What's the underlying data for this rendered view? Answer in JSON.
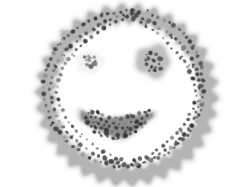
{
  "image": {
    "title": "Smiley face bacterial colony plate",
    "width": 252,
    "height": 187,
    "background_color": "#ffffff",
    "border_color": "#a8a8a8",
    "border_inset_px": 5,
    "medium_color": "#ffffff"
  },
  "palette": {
    "halo": "#d2d2d2",
    "band": "#b4b4b4",
    "band_edge": "#a5a5a5",
    "mouth_fill": "#8f8f8f",
    "mouth_halo": "#c6c6c6",
    "eye_fill": "#c0c0c0",
    "eye_halo": "#d8d8d8",
    "colony_dark": "#3a3a3a",
    "colony_mid": "#5e5e5e",
    "colony_light": "#8a8a8a"
  },
  "features": [
    {
      "name": "face-outline-ring",
      "label": "Face outline ring",
      "shape": "scalloped-annulus",
      "center": [
        127,
        95
      ],
      "outer_radius": 88,
      "inner_radius": 74,
      "scallop_count": 34,
      "scallop_amplitude": 3.2,
      "fill": "#b4b4b4",
      "halo": "#d2d2d2",
      "colony_count": 210
    },
    {
      "name": "left-eye",
      "label": "Left eye",
      "shape": "sparse-cluster",
      "center": [
        90,
        62
      ],
      "radius_x": 13,
      "radius_y": 11,
      "fill": "#f2f2f2",
      "halo": "#fafafa",
      "colony_count": 11
    },
    {
      "name": "right-eye",
      "label": "Right eye",
      "shape": "irregular-blob",
      "center": [
        153,
        61
      ],
      "radius_x": 16,
      "radius_y": 15,
      "fill": "#c0c0c0",
      "halo": "#d8d8d8",
      "colony_count": 14
    },
    {
      "name": "mouth",
      "label": "Mouth (smile crescent)",
      "shape": "crescent",
      "center": [
        117,
        122
      ],
      "width": 72,
      "height": 36,
      "fill": "#8f8f8f",
      "halo": "#c6c6c6",
      "colony_count": 58
    }
  ],
  "chart_data": {
    "type": "scatter",
    "title": "Smiley face bacterial colony plate",
    "xlabel": "",
    "ylabel": "",
    "xlim": [
      0,
      252
    ],
    "ylim": [
      0,
      187
    ],
    "grid": false,
    "legend": "none",
    "series": [
      {
        "name": "face-outline-ring",
        "color": "#3a3a3a",
        "marker": "blob",
        "points": [
          [
            127,
            11
          ],
          [
            133,
            11
          ],
          [
            120,
            12
          ],
          [
            139,
            12
          ],
          [
            114,
            13
          ],
          [
            146,
            13
          ],
          [
            107,
            14
          ],
          [
            152,
            15
          ],
          [
            101,
            16
          ],
          [
            158,
            17
          ],
          [
            95,
            18
          ],
          [
            164,
            20
          ],
          [
            89,
            21
          ],
          [
            169,
            23
          ],
          [
            83,
            24
          ],
          [
            174,
            26
          ],
          [
            78,
            27
          ],
          [
            179,
            30
          ],
          [
            73,
            31
          ],
          [
            183,
            34
          ],
          [
            68,
            35
          ],
          [
            187,
            38
          ],
          [
            64,
            39
          ],
          [
            190,
            42
          ],
          [
            60,
            44
          ],
          [
            193,
            47
          ],
          [
            56,
            49
          ],
          [
            196,
            52
          ],
          [
            53,
            54
          ],
          [
            198,
            57
          ],
          [
            50,
            59
          ],
          [
            200,
            63
          ],
          [
            48,
            65
          ],
          [
            201,
            68
          ],
          [
            46,
            70
          ],
          [
            202,
            74
          ],
          [
            45,
            76
          ],
          [
            203,
            80
          ],
          [
            44,
            82
          ],
          [
            203,
            86
          ],
          [
            44,
            88
          ],
          [
            203,
            92
          ],
          [
            44,
            94
          ],
          [
            202,
            98
          ],
          [
            45,
            100
          ],
          [
            201,
            104
          ],
          [
            46,
            106
          ],
          [
            200,
            110
          ],
          [
            48,
            112
          ],
          [
            198,
            115
          ],
          [
            50,
            118
          ],
          [
            196,
            121
          ],
          [
            53,
            123
          ],
          [
            193,
            126
          ],
          [
            56,
            128
          ],
          [
            190,
            131
          ],
          [
            60,
            133
          ],
          [
            187,
            136
          ],
          [
            64,
            138
          ],
          [
            183,
            140
          ],
          [
            68,
            142
          ],
          [
            179,
            144
          ],
          [
            73,
            146
          ],
          [
            174,
            148
          ],
          [
            78,
            150
          ],
          [
            169,
            152
          ],
          [
            83,
            154
          ],
          [
            164,
            155
          ],
          [
            89,
            157
          ],
          [
            158,
            158
          ],
          [
            95,
            160
          ],
          [
            152,
            161
          ],
          [
            101,
            162
          ],
          [
            146,
            163
          ],
          [
            107,
            164
          ],
          [
            139,
            165
          ],
          [
            114,
            166
          ],
          [
            133,
            166
          ],
          [
            120,
            167
          ],
          [
            127,
            167
          ],
          [
            131,
            14
          ],
          [
            124,
            15
          ],
          [
            137,
            16
          ],
          [
            118,
            17
          ],
          [
            143,
            18
          ],
          [
            111,
            19
          ],
          [
            149,
            21
          ],
          [
            105,
            22
          ],
          [
            155,
            24
          ],
          [
            99,
            25
          ],
          [
            160,
            28
          ],
          [
            93,
            29
          ],
          [
            166,
            31
          ],
          [
            87,
            33
          ],
          [
            171,
            35
          ],
          [
            81,
            37
          ],
          [
            176,
            39
          ],
          [
            76,
            41
          ],
          [
            180,
            43
          ],
          [
            71,
            46
          ],
          [
            184,
            48
          ],
          [
            67,
            50
          ],
          [
            188,
            53
          ],
          [
            63,
            55
          ],
          [
            191,
            58
          ],
          [
            59,
            60
          ],
          [
            194,
            64
          ],
          [
            56,
            66
          ],
          [
            196,
            69
          ],
          [
            54,
            71
          ],
          [
            198,
            75
          ],
          [
            52,
            77
          ],
          [
            199,
            81
          ],
          [
            51,
            83
          ],
          [
            200,
            87
          ],
          [
            50,
            90
          ],
          [
            200,
            94
          ],
          [
            51,
            97
          ],
          [
            199,
            101
          ],
          [
            52,
            103
          ],
          [
            198,
            107
          ],
          [
            54,
            110
          ],
          [
            196,
            113
          ],
          [
            56,
            116
          ],
          [
            194,
            119
          ],
          [
            59,
            122
          ],
          [
            191,
            125
          ],
          [
            63,
            127
          ],
          [
            188,
            129
          ],
          [
            67,
            132
          ],
          [
            184,
            134
          ],
          [
            71,
            137
          ],
          [
            180,
            139
          ],
          [
            76,
            141
          ],
          [
            176,
            143
          ],
          [
            81,
            145
          ],
          [
            171,
            147
          ],
          [
            87,
            149
          ],
          [
            166,
            151
          ],
          [
            93,
            153
          ],
          [
            160,
            154
          ],
          [
            99,
            156
          ],
          [
            155,
            157
          ],
          [
            105,
            159
          ],
          [
            149,
            160
          ],
          [
            111,
            161
          ],
          [
            143,
            162
          ],
          [
            118,
            163
          ],
          [
            137,
            164
          ],
          [
            124,
            165
          ],
          [
            131,
            165
          ],
          [
            127,
            17
          ],
          [
            122,
            19
          ],
          [
            134,
            19
          ],
          [
            116,
            21
          ],
          [
            140,
            22
          ],
          [
            110,
            24
          ],
          [
            146,
            26
          ],
          [
            104,
            28
          ],
          [
            152,
            30
          ],
          [
            98,
            32
          ],
          [
            157,
            34
          ],
          [
            92,
            37
          ],
          [
            163,
            38
          ],
          [
            86,
            41
          ],
          [
            168,
            43
          ],
          [
            81,
            45
          ],
          [
            172,
            48
          ],
          [
            76,
            50
          ],
          [
            177,
            52
          ],
          [
            72,
            55
          ],
          [
            181,
            57
          ],
          [
            68,
            59
          ],
          [
            185,
            62
          ],
          [
            65,
            64
          ],
          [
            188,
            67
          ],
          [
            62,
            69
          ],
          [
            190,
            72
          ],
          [
            60,
            74
          ],
          [
            193,
            78
          ],
          [
            58,
            80
          ],
          [
            195,
            84
          ],
          [
            57,
            86
          ],
          [
            196,
            90
          ],
          [
            57,
            93
          ],
          [
            196,
            96
          ],
          [
            58,
            99
          ],
          [
            195,
            103
          ],
          [
            60,
            106
          ],
          [
            193,
            109
          ],
          [
            62,
            111
          ],
          [
            190,
            114
          ],
          [
            65,
            117
          ],
          [
            188,
            119
          ],
          [
            68,
            122
          ],
          [
            185,
            124
          ],
          [
            72,
            126
          ],
          [
            181,
            129
          ],
          [
            76,
            131
          ],
          [
            177,
            133
          ],
          [
            81,
            136
          ],
          [
            172,
            138
          ],
          [
            86,
            140
          ],
          [
            168,
            142
          ],
          [
            92,
            144
          ],
          [
            163,
            146
          ],
          [
            98,
            148
          ],
          [
            157,
            150
          ],
          [
            104,
            152
          ],
          [
            152,
            153
          ],
          [
            110,
            155
          ],
          [
            146,
            157
          ],
          [
            116,
            158
          ],
          [
            140,
            159
          ],
          [
            122,
            160
          ],
          [
            134,
            161
          ]
        ]
      },
      {
        "name": "left-eye",
        "color": "#4a4a4a",
        "marker": "blob",
        "points": [
          [
            85,
            57
          ],
          [
            88,
            56
          ],
          [
            91,
            57
          ],
          [
            94,
            58
          ],
          [
            96,
            60
          ],
          [
            86,
            60
          ],
          [
            89,
            60
          ],
          [
            92,
            62
          ],
          [
            87,
            64
          ],
          [
            91,
            66
          ],
          [
            94,
            63
          ]
        ]
      },
      {
        "name": "right-eye",
        "color": "#3a3a3a",
        "marker": "blob",
        "points": [
          [
            146,
            54
          ],
          [
            151,
            53
          ],
          [
            156,
            55
          ],
          [
            160,
            58
          ],
          [
            144,
            59
          ],
          [
            149,
            59
          ],
          [
            154,
            60
          ],
          [
            159,
            63
          ],
          [
            146,
            64
          ],
          [
            151,
            66
          ],
          [
            156,
            67
          ],
          [
            149,
            70
          ],
          [
            155,
            71
          ],
          [
            160,
            68
          ]
        ]
      },
      {
        "name": "mouth",
        "color": "#2e2e2e",
        "marker": "blob",
        "points": [
          [
            88,
            114
          ],
          [
            93,
            112
          ],
          [
            98,
            113
          ],
          [
            103,
            115
          ],
          [
            109,
            117
          ],
          [
            115,
            118
          ],
          [
            121,
            118
          ],
          [
            127,
            117
          ],
          [
            133,
            116
          ],
          [
            139,
            114
          ],
          [
            145,
            112
          ],
          [
            149,
            111
          ],
          [
            86,
            118
          ],
          [
            91,
            117
          ],
          [
            96,
            118
          ],
          [
            101,
            120
          ],
          [
            107,
            122
          ],
          [
            113,
            123
          ],
          [
            119,
            124
          ],
          [
            125,
            123
          ],
          [
            131,
            122
          ],
          [
            137,
            121
          ],
          [
            143,
            118
          ],
          [
            147,
            116
          ],
          [
            88,
            122
          ],
          [
            93,
            122
          ],
          [
            98,
            123
          ],
          [
            104,
            125
          ],
          [
            110,
            127
          ],
          [
            116,
            128
          ],
          [
            122,
            128
          ],
          [
            128,
            127
          ],
          [
            134,
            126
          ],
          [
            140,
            124
          ],
          [
            145,
            122
          ],
          [
            91,
            127
          ],
          [
            96,
            127
          ],
          [
            101,
            128
          ],
          [
            107,
            130
          ],
          [
            113,
            131
          ],
          [
            119,
            132
          ],
          [
            125,
            131
          ],
          [
            131,
            130
          ],
          [
            137,
            128
          ],
          [
            142,
            126
          ],
          [
            95,
            131
          ],
          [
            100,
            132
          ],
          [
            106,
            133
          ],
          [
            112,
            134
          ],
          [
            118,
            135
          ],
          [
            124,
            134
          ],
          [
            130,
            133
          ],
          [
            136,
            131
          ],
          [
            101,
            136
          ],
          [
            107,
            137
          ],
          [
            113,
            138
          ],
          [
            119,
            137
          ],
          [
            125,
            136
          ]
        ]
      }
    ]
  }
}
